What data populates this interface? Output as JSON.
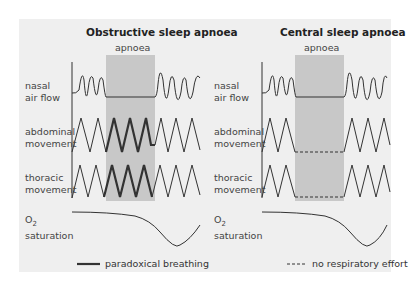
{
  "left_panel": {
    "title": "Obstructive sleep apnoea",
    "apnoea_label": "apnoea",
    "rows": [
      {
        "line1": "nasal",
        "line2": "air flow"
      },
      {
        "line1": "abdominal",
        "line2": "movement"
      },
      {
        "line1": "thoracic",
        "line2": "movement"
      },
      {
        "line1": "O",
        "sub": "2",
        "line2": "saturation"
      }
    ],
    "legend": "paradoxical breathing"
  },
  "right_panel": {
    "title": "Central sleep apnoea",
    "apnoea_label": "apnoea",
    "rows": [
      {
        "line1": "nasal",
        "line2": "air flow"
      },
      {
        "line1": "abdominal",
        "line2": "movement"
      },
      {
        "line1": "thoracic",
        "line2": "movement"
      },
      {
        "line1": "O",
        "sub": "2",
        "line2": "saturation"
      }
    ],
    "legend": "no respiratory effort"
  },
  "colors": {
    "background": "#efefef",
    "apnoea_shade": "#c8c8c8",
    "line": "#333333"
  }
}
